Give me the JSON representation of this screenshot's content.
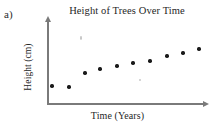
{
  "figure": {
    "part_label": "a)"
  },
  "chart_data": {
    "type": "scatter",
    "title": "Height of Trees Over Time",
    "xlabel": "Time (Years)",
    "ylabel": "Height (cm)",
    "grid": false,
    "legend": false,
    "xlim": [
      0,
      12
    ],
    "ylim": [
      0,
      10
    ],
    "axis_ticks": false,
    "marker_color": "#1a1a1a",
    "axis_color": "#7a7a7a",
    "x": [
      1,
      2,
      3,
      4,
      5,
      6,
      7,
      8,
      9,
      10
    ],
    "y": [
      2.2,
      2.1,
      3.6,
      4.1,
      4.4,
      4.6,
      5.3,
      5.9,
      6.2,
      6.7
    ],
    "points": [
      {
        "x": 1,
        "y": 2.2,
        "px": 52,
        "py": 86,
        "faint": false
      },
      {
        "x": 2,
        "y": 2.1,
        "px": 69,
        "py": 87,
        "faint": false
      },
      {
        "x": 3,
        "y": 3.6,
        "px": 85,
        "py": 73,
        "faint": false
      },
      {
        "x": 4,
        "y": 4.1,
        "px": 100,
        "py": 69,
        "faint": false
      },
      {
        "x": 5,
        "y": 4.4,
        "px": 117,
        "py": 66,
        "faint": false
      },
      {
        "x": 6,
        "y": 4.6,
        "px": 133,
        "py": 63,
        "faint": false
      },
      {
        "x": 7,
        "y": 5.3,
        "px": 150,
        "py": 61,
        "faint": false
      },
      {
        "x": 8,
        "y": 5.9,
        "px": 167,
        "py": 56,
        "faint": false
      },
      {
        "x": 9,
        "y": 6.2,
        "px": 183,
        "py": 53,
        "faint": false
      },
      {
        "x": 10,
        "y": 6.7,
        "px": 199,
        "py": 49,
        "faint": false
      },
      {
        "x": 6.2,
        "y": 2.9,
        "px": 140,
        "py": 80,
        "faint": true
      }
    ],
    "artifacts": [
      {
        "px": 81,
        "py": 38,
        "w": 2.4,
        "h": 3.4
      }
    ]
  }
}
